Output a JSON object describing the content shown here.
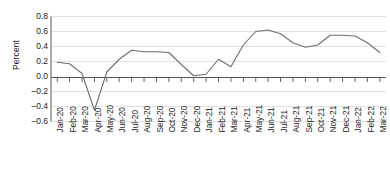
{
  "chart_data": {
    "type": "line",
    "title": "",
    "xlabel": "",
    "ylabel": "Percent",
    "ylim": [
      -0.6,
      0.8
    ],
    "yticks": [
      0.8,
      0.6,
      0.4,
      0.2,
      0.0,
      -0.2,
      -0.4,
      -0.6
    ],
    "ytick_labels": [
      "0.8",
      "0.6",
      "0.4",
      "0.2",
      "0.0",
      "–0.2",
      "–0.4",
      "–0.6"
    ],
    "grid": true,
    "grid_axis": "y",
    "legend": "none",
    "zero_line": true,
    "line_color": "#6f6f6f",
    "grid_color": "#d9d9d9",
    "axis_color": "#444444",
    "categories": [
      "Jan-20",
      "Feb-20",
      "Mar-20",
      "Apr-20",
      "May-20",
      "Jun-20",
      "Jul-20",
      "Aug-20",
      "Sep-20",
      "Oct-20",
      "Nov-20",
      "Dec-20",
      "Jan-21",
      "Feb-21",
      "Mar-21",
      "Apr-21",
      "May-21",
      "Jun-21",
      "Jul-21",
      "Aug-21",
      "Sep-21",
      "Oct-21",
      "Nov-21",
      "Dec-21",
      "Jan-22",
      "Feb-22",
      "Mar-22"
    ],
    "series": [
      {
        "name": "Percent",
        "values": [
          0.19,
          0.17,
          0.04,
          -0.45,
          0.06,
          0.23,
          0.35,
          0.33,
          0.33,
          0.32,
          0.16,
          0.01,
          0.03,
          0.23,
          0.13,
          0.42,
          0.6,
          0.62,
          0.57,
          0.45,
          0.39,
          0.42,
          0.55,
          0.55,
          0.54,
          0.45,
          0.32
        ]
      }
    ]
  }
}
